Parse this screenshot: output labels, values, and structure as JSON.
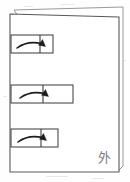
{
  "document": {
    "title": "Scanned page with three callout boxes",
    "page_label": "外",
    "background_color": "#fefefe",
    "ink_color": "#1c1c1c",
    "sheet_border_color": "#595959",
    "box_border_color": "#4a4a4a",
    "annotation_color": "#7a7a7a"
  },
  "sheet": {
    "name": "page-sheet",
    "x": 10,
    "y": 14,
    "width": 109,
    "height": 158,
    "has_stacked_page_behind": true,
    "stacked_page_offset_x": 4,
    "stacked_page_offset_y": -5
  },
  "boxes": [
    {
      "index": 1,
      "label": "callout-box-1",
      "x": 11,
      "y": 35,
      "width": 42,
      "height": 18,
      "divider_x": 40,
      "arrow": "curved-arrow-right",
      "arrow_direction": "right"
    },
    {
      "index": 2,
      "label": "callout-box-2",
      "x": 11,
      "y": 85,
      "width": 62,
      "height": 18,
      "divider_x": 43,
      "arrow": "curved-arrow-right",
      "arrow_direction": "right"
    },
    {
      "index": 3,
      "label": "callout-box-3",
      "x": 11,
      "y": 129,
      "width": 47,
      "height": 18,
      "divider_x": 41,
      "arrow": "curved-arrow-right",
      "arrow_direction": "right"
    }
  ],
  "margin_marks": {
    "name": "left-margin-dotted-ticks",
    "count": 3,
    "color": "#bdbdbd"
  },
  "corner_annotation": {
    "name": "handwritten-character",
    "text": "外",
    "x": 98,
    "y": 149
  }
}
